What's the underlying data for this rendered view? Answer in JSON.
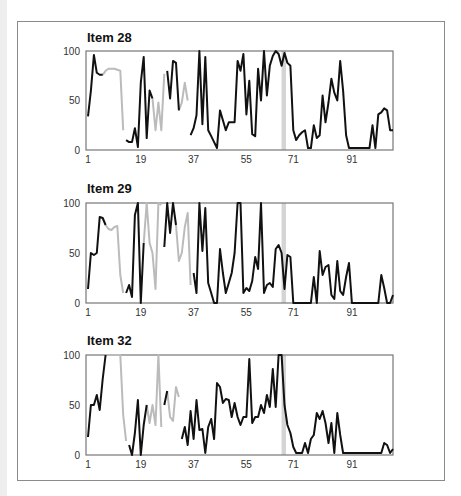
{
  "colors": {
    "line": "#111111",
    "missing": "#bbbbbb",
    "band": "#d4d4d4",
    "axis": "#777777"
  },
  "chart_data": [
    {
      "type": "line",
      "title": "Item 28",
      "xlabel": "",
      "ylabel": "",
      "xlim": [
        1,
        105
      ],
      "ylim": [
        0,
        100
      ],
      "x_ticks": [
        1,
        19,
        37,
        55,
        71,
        91
      ],
      "y_ticks": [
        0,
        50,
        100
      ],
      "highlight_band": [
        67,
        68.5
      ],
      "grid": false,
      "values": [
        34,
        60,
        96,
        78,
        76,
        76,
        80,
        82,
        82,
        82,
        81,
        80,
        20,
        10,
        8,
        8,
        22,
        3,
        68,
        94,
        12,
        60,
        52,
        20,
        48,
        20,
        77,
        80,
        52,
        90,
        88,
        40,
        48,
        68,
        50,
        15,
        22,
        35,
        100,
        26,
        94,
        20,
        14,
        8,
        2,
        40,
        30,
        20,
        28,
        28,
        28,
        90,
        80,
        97,
        36,
        70,
        16,
        14,
        82,
        50,
        100,
        55,
        85,
        95,
        100,
        97,
        85,
        98,
        88,
        85,
        20,
        10,
        15,
        18,
        20,
        2,
        2,
        25,
        12,
        15,
        55,
        28,
        48,
        72,
        58,
        50,
        90,
        60,
        15,
        2,
        2,
        2,
        2,
        2,
        2,
        2,
        2,
        25,
        2,
        36,
        38,
        42,
        40,
        20,
        20
      ],
      "gray_segments": [
        [
          5,
          12
        ],
        [
          22,
          26
        ],
        [
          31,
          34
        ]
      ]
    },
    {
      "type": "line",
      "title": "Item 29",
      "xlabel": "",
      "ylabel": "",
      "xlim": [
        1,
        105
      ],
      "ylim": [
        0,
        100
      ],
      "x_ticks": [
        1,
        19,
        37,
        55,
        71,
        91
      ],
      "y_ticks": [
        0,
        50,
        100
      ],
      "highlight_band": [
        67,
        68.5
      ],
      "grid": false,
      "values": [
        14,
        50,
        48,
        50,
        86,
        85,
        78,
        74,
        73,
        76,
        77,
        28,
        10,
        10,
        18,
        6,
        88,
        100,
        0,
        60,
        100,
        60,
        50,
        14,
        100,
        98,
        56,
        100,
        70,
        100,
        78,
        42,
        50,
        76,
        90,
        18,
        30,
        10,
        100,
        52,
        95,
        20,
        10,
        0,
        0,
        54,
        30,
        10,
        20,
        30,
        50,
        100,
        100,
        10,
        15,
        12,
        22,
        46,
        34,
        100,
        10,
        18,
        20,
        16,
        54,
        58,
        50,
        14,
        48,
        46,
        0,
        0,
        0,
        0,
        0,
        0,
        0,
        26,
        0,
        52,
        28,
        36,
        38,
        8,
        4,
        42,
        12,
        8,
        26,
        40,
        0,
        0,
        0,
        0,
        0,
        0,
        0,
        0,
        0,
        0,
        28,
        15,
        0,
        0,
        8
      ],
      "gray_segments": [
        [
          6,
          12
        ],
        [
          19,
          25
        ],
        [
          30,
          35
        ]
      ]
    },
    {
      "type": "line",
      "title": "Item 32",
      "xlabel": "",
      "ylabel": "",
      "xlim": [
        1,
        105
      ],
      "ylim": [
        0,
        100
      ],
      "x_ticks": [
        1,
        19,
        37,
        55,
        71,
        91
      ],
      "y_ticks": [
        0,
        50,
        100
      ],
      "highlight_band": [
        67,
        68.5
      ],
      "grid": false,
      "values": [
        18,
        50,
        50,
        60,
        45,
        76,
        100,
        100,
        100,
        100,
        100,
        100,
        40,
        14,
        10,
        0,
        22,
        55,
        0,
        30,
        50,
        32,
        50,
        30,
        100,
        28,
        50,
        64,
        38,
        34,
        68,
        58,
        16,
        28,
        10,
        44,
        16,
        55,
        25,
        26,
        2,
        28,
        36,
        16,
        72,
        68,
        52,
        56,
        55,
        38,
        52,
        38,
        30,
        38,
        38,
        96,
        32,
        38,
        38,
        50,
        42,
        60,
        48,
        86,
        48,
        100,
        100,
        50,
        30,
        22,
        8,
        2,
        2,
        2,
        12,
        2,
        16,
        20,
        42,
        36,
        44,
        32,
        12,
        32,
        2,
        42,
        20,
        2,
        2,
        2,
        2,
        2,
        2,
        2,
        2,
        2,
        2,
        2,
        2,
        2,
        2,
        12,
        10,
        2,
        6
      ],
      "gray_segments": [
        [
          6,
          13
        ],
        [
          20,
          25
        ],
        [
          27,
          31
        ]
      ]
    }
  ]
}
